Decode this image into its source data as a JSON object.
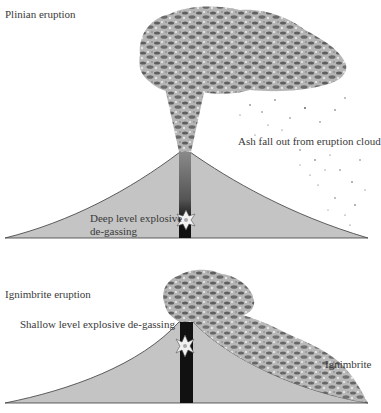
{
  "diagram": {
    "panels": [
      {
        "title": "Plinian eruption",
        "labels": {
          "cloud": "Ash fall out from eruption cloud",
          "degassing_line1": "Deep level explosive",
          "degassing_line2": "de-gassing"
        }
      },
      {
        "title": "Ignimbrite eruption",
        "labels": {
          "degassing": "Shallow level explosive de-gassing",
          "flow": "Ignimbrite"
        }
      }
    ],
    "colors": {
      "volcano_fill": "#c4c4c4",
      "volcano_outline": "#3a3a3a",
      "conduit": "#111111",
      "ash": "#6b6b6b",
      "text": "#3a3a3a"
    }
  }
}
